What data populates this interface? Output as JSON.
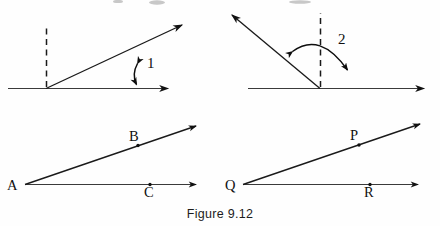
{
  "figure": {
    "caption": "Figure 9.12",
    "ink_color": "#101010",
    "background_color": "#fefefe",
    "panels": [
      {
        "id": "top-left",
        "name": "angle-1-panel",
        "description": "acute angle formed by a horizontal ray and an upward slanted ray, with a dashed vertical reference line at the vertex and a double-headed arc arrow measuring the angle",
        "angle_label": "1",
        "has_dashed_reference": true,
        "arc_style": "double-headed",
        "rays": [
          {
            "name": "horizontal-ray",
            "direction": "right"
          },
          {
            "name": "slanted-ray",
            "direction": "up-right"
          }
        ]
      },
      {
        "id": "top-right",
        "name": "angle-2-panel",
        "description": "obtuse angle formed by a horizontal ray pointing right and a slanted ray pointing up-left, with a dashed vertical reference line at the vertex and a large double-headed arc arrow",
        "angle_label": "2",
        "has_dashed_reference": true,
        "arc_style": "double-headed",
        "rays": [
          {
            "name": "horizontal-ray",
            "direction": "right"
          },
          {
            "name": "slanted-ray",
            "direction": "up-left"
          }
        ]
      },
      {
        "id": "bottom-left",
        "name": "angle-bac-panel",
        "description": "angle with vertex A, point B marked on the upper slanted ray and point C marked on the lower horizontal ray",
        "vertex_label": "A",
        "points": [
          {
            "label": "B",
            "on_ray": "upper-slanted-ray",
            "label_position": "above"
          },
          {
            "label": "C",
            "on_ray": "lower-horizontal-ray",
            "label_position": "below"
          }
        ]
      },
      {
        "id": "bottom-right",
        "name": "angle-pqr-panel",
        "description": "angle with vertex Q, point P marked on the upper slanted ray and point R marked on the lower horizontal ray",
        "vertex_label": "Q",
        "points": [
          {
            "label": "P",
            "on_ray": "upper-slanted-ray",
            "label_position": "above"
          },
          {
            "label": "R",
            "on_ray": "lower-horizontal-ray",
            "label_position": "below"
          }
        ]
      }
    ]
  }
}
